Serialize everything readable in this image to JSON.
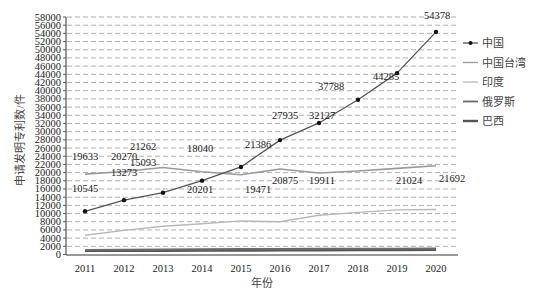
{
  "chart_data": {
    "type": "line",
    "title": "",
    "xlabel": "年份",
    "ylabel": "申请发明专利数/件",
    "ylim": [
      0,
      58000
    ],
    "ytick_step": 2000,
    "grid": "horizontal-dashed",
    "legend_position": "right",
    "categories": [
      "2011",
      "2012",
      "2013",
      "2014",
      "2015",
      "2016",
      "2017",
      "2018",
      "2019",
      "2020"
    ],
    "series": [
      {
        "name": "中国",
        "color": "#555555",
        "marker": "dot",
        "labeled": true,
        "values": [
          10545,
          13273,
          15093,
          18040,
          21386,
          27935,
          32127,
          37788,
          44285,
          54378
        ]
      },
      {
        "name": "中国台湾",
        "color": "#9a9a9a",
        "marker": "none",
        "labeled": true,
        "values": [
          19633,
          20270,
          21262,
          20201,
          19471,
          20875,
          19911,
          20400,
          21024,
          21692
        ]
      },
      {
        "name": "印度",
        "color": "#b8b8b8",
        "marker": "none",
        "labeled": false,
        "values": [
          4700,
          5900,
          6900,
          7500,
          8200,
          8000,
          9600,
          10300,
          10900,
          11000
        ]
      },
      {
        "name": "俄罗斯",
        "color": "#6a6a6a",
        "marker": "none",
        "labeled": false,
        "values": [
          1100,
          1150,
          1200,
          1250,
          1300,
          1300,
          1350,
          1400,
          1400,
          1450
        ]
      },
      {
        "name": "巴西",
        "color": "#555555",
        "marker": "none",
        "labeled": false,
        "values": [
          900,
          950,
          950,
          1000,
          1000,
          1050,
          1050,
          1100,
          1100,
          1150
        ]
      }
    ],
    "annotations": {
      "中国": [
        "10545",
        "13273",
        "15093",
        "18040",
        "21386",
        "27935",
        "32127",
        "37788",
        "44285",
        "54378"
      ],
      "中国台湾": [
        "19633",
        "20270",
        "21262",
        "20201",
        "19471",
        "20875",
        "19911",
        "",
        "21024",
        "21692"
      ]
    }
  }
}
